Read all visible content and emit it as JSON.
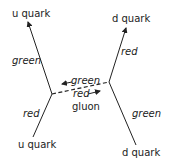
{
  "diagram": {
    "quarks": {
      "top_left": "u quark",
      "top_right": "d quark",
      "bottom_left": "u quark",
      "bottom_right": "d quark"
    },
    "colors": {
      "top_left_line": "green",
      "top_right_line": "red",
      "bottom_left_line": "red",
      "bottom_right_line": "green"
    },
    "gluon": {
      "label": "gluon",
      "upper_color": "green",
      "lower_color": "red"
    },
    "line_color": "#222222"
  }
}
